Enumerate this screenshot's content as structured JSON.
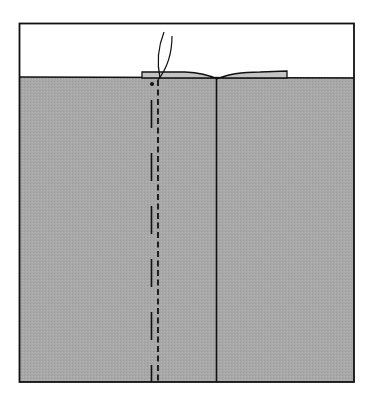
{
  "diagram": {
    "colors": {
      "background": "#ffffff",
      "fabric": "#a9a9a9",
      "fabric_flap": "#c4c4c4",
      "ink": "#111111"
    },
    "frame": {
      "x": 19,
      "y": 23,
      "width": 335,
      "height": 359
    },
    "fabric": {
      "top_y": 77
    },
    "center_seam_x": 216,
    "stitch_line_x": 158,
    "basting_line_x": 151,
    "flap": {
      "left_x": 142,
      "right_x": 287,
      "top_y": 72,
      "dip_y": 79
    },
    "thread_tails": 2,
    "marker_dot": {
      "x": 152,
      "y": 84
    }
  }
}
